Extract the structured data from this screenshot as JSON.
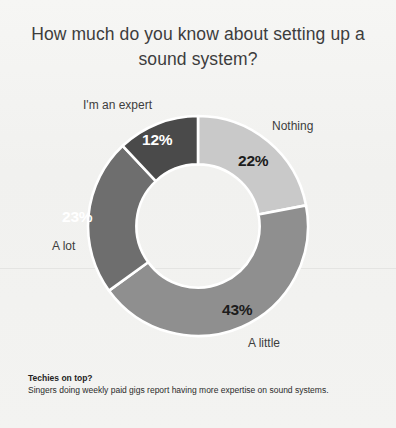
{
  "chart_data": {
    "type": "pie",
    "variant": "donut",
    "title": "How much do you know about setting up a sound system?",
    "categories": [
      "Nothing",
      "A little",
      "A lot",
      "I'm an expert"
    ],
    "values": [
      22,
      43,
      23,
      12
    ],
    "value_labels": [
      "22%",
      "43%",
      "23%",
      "12%"
    ],
    "units": "percent",
    "start_angle_deg": 0,
    "direction": "clockwise",
    "hole_ratio": 0.56,
    "legend": "none",
    "grid": false,
    "slice_colors": [
      "#c9c9c9",
      "#8f8f8f",
      "#6e6e6e",
      "#4a4a4a"
    ],
    "value_text_colors": [
      "#1c1c1c",
      "#1c1c1c",
      "#ffffff",
      "#ffffff"
    ],
    "background": "#f2f2f0",
    "separator_color": "#ffffff",
    "annotations": [
      "Techies on top?",
      "Singers doing weekly paid gigs report having more expertise on sound systems."
    ]
  },
  "footnote": {
    "title": "Techies on top?",
    "body": "Singers doing weekly paid gigs report having more expertise on sound systems."
  }
}
